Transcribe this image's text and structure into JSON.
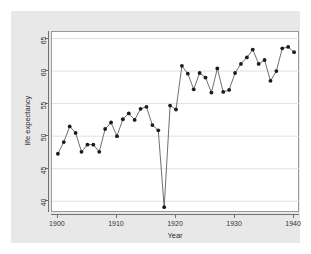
{
  "figure": {
    "background_color": "#ffffff",
    "panel_color": "#e8e8e8",
    "plot_color": "#ffffff",
    "border_color": "#9a9a9a"
  },
  "chart_data": {
    "type": "line",
    "title": "",
    "subtitle": "",
    "xlabel": "Year",
    "ylabel": "life expectancy",
    "xlim": [
      1899,
      1941
    ],
    "ylim": [
      38.2,
      66.0
    ],
    "xticks": [
      1900,
      1910,
      1920,
      1930,
      1940
    ],
    "xtick_labels": [
      "1900",
      "1910",
      "1920",
      "1930",
      "1940"
    ],
    "yticks": [
      40,
      45,
      50,
      55,
      60,
      65
    ],
    "ytick_labels": [
      "40",
      "45",
      "50",
      "55",
      "60",
      "65"
    ],
    "grid": "horizontal",
    "grid_color": "#e0e0e4",
    "legend": "none",
    "marker": "filled-circle",
    "marker_color": "#1a1a22",
    "line_color": "#4a4a52",
    "x": [
      1900,
      1901,
      1902,
      1903,
      1904,
      1905,
      1906,
      1907,
      1908,
      1909,
      1910,
      1911,
      1912,
      1913,
      1914,
      1915,
      1916,
      1917,
      1918,
      1919,
      1920,
      1921,
      1922,
      1923,
      1924,
      1925,
      1926,
      1927,
      1928,
      1929,
      1930,
      1931,
      1932,
      1933,
      1934,
      1935,
      1936,
      1937,
      1938,
      1939,
      1940
    ],
    "values": [
      47.3,
      49.1,
      51.5,
      50.5,
      47.6,
      48.7,
      48.7,
      47.6,
      51.1,
      52.1,
      50.0,
      52.6,
      53.5,
      52.5,
      54.2,
      54.5,
      51.7,
      50.9,
      39.1,
      54.7,
      54.1,
      60.8,
      59.6,
      57.2,
      59.7,
      59.0,
      56.7,
      60.4,
      56.8,
      57.1,
      59.7,
      61.1,
      62.1,
      63.3,
      61.1,
      61.7,
      58.5,
      60.0,
      63.5,
      63.7,
      62.9
    ],
    "annotations": [
      {
        "x": 1918,
        "y": 39.1,
        "note": "pandemic trough"
      }
    ],
    "series": [
      {
        "name": "life expectancy",
        "values": [
          47.3,
          49.1,
          51.5,
          50.5,
          47.6,
          48.7,
          48.7,
          47.6,
          51.1,
          52.1,
          50.0,
          52.6,
          53.5,
          52.5,
          54.2,
          54.5,
          51.7,
          50.9,
          39.1,
          54.7,
          54.1,
          60.8,
          59.6,
          57.2,
          59.7,
          59.0,
          56.7,
          60.4,
          56.8,
          57.1,
          59.7,
          61.1,
          62.1,
          63.3,
          61.1,
          61.7,
          58.5,
          60.0,
          63.5,
          63.7,
          62.9
        ]
      }
    ]
  }
}
